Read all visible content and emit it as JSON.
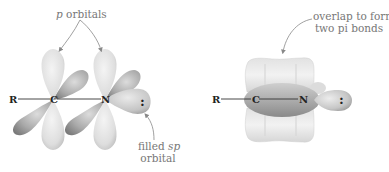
{
  "figure": {
    "left_panel": {
      "title_label": {
        "italic": "p",
        "text": " orbitals"
      },
      "atoms": {
        "r": "R",
        "c": "C",
        "n": "N",
        "lone_pair": ":"
      },
      "callout": {
        "line1_prefix": "filled ",
        "line1_italic": "sp",
        "line2": "orbital"
      }
    },
    "right_panel": {
      "callout": {
        "line1": "overlap to form",
        "line2": "two pi bonds"
      },
      "atoms": {
        "r": "R",
        "c": "C",
        "n": "N",
        "lone_pair": ":"
      }
    },
    "colors": {
      "lobe_light": "#e6e6e6",
      "lobe_mid": "#c8c8c8",
      "lobe_dark": "#8c8c8c",
      "label_text": "#777777",
      "atom_text": "#222222",
      "arrow": "#888888"
    }
  }
}
